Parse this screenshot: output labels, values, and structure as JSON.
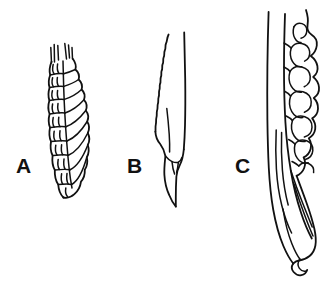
{
  "figure": {
    "background_color": "#ffffff",
    "ink_color": "#111111",
    "width": 329,
    "height": 283,
    "style": "black-ink line art, no shading, no fill"
  },
  "panels": [
    {
      "label": "A",
      "label_position": {
        "x": 16,
        "y": 155
      },
      "description": "Narrow elongate spike with overlapping imbricate scale-like lemmas along its length, tapering to a rounded tip at bottom; awn-like bristles project from the top.",
      "bounds": {
        "x": 44,
        "y": 42,
        "width": 48,
        "height": 158
      }
    },
    {
      "label": "B",
      "label_position": {
        "x": 127,
        "y": 155
      },
      "description": "Slender straight structure with a finely crenulate wavy left margin and a smooth straight right margin, widening near the base into a pointed lobed tip.",
      "bounds": {
        "x": 157,
        "y": 32,
        "width": 44,
        "height": 180
      }
    },
    {
      "label": "C",
      "label_position": {
        "x": 235,
        "y": 155
      },
      "description": "Broad elongate structure with deeply lobed undulate right margin enclosing several large rounded scales, a long straight slender bract at left, tapering to an acute point at bottom.",
      "bounds": {
        "x": 262,
        "y": 8,
        "width": 62,
        "height": 272
      }
    }
  ],
  "labels": {
    "a": "A",
    "b": "B",
    "c": "C"
  }
}
